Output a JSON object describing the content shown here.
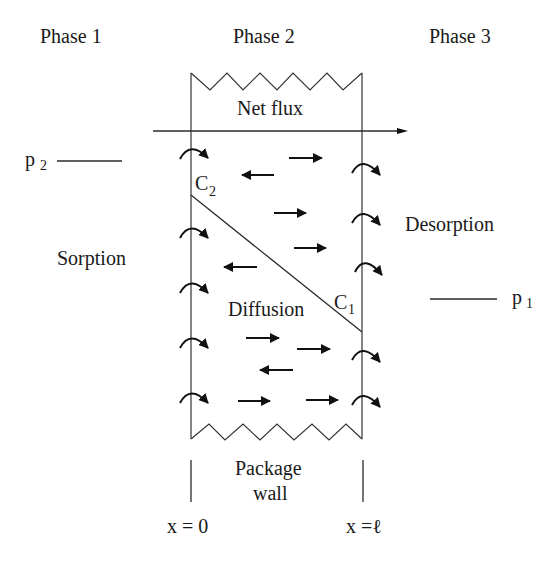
{
  "diagram": {
    "phases": {
      "phase1": "Phase 1",
      "phase2": "Phase 2",
      "phase3": "Phase 3"
    },
    "labels": {
      "net_flux": "Net flux",
      "sorption": "Sorption",
      "desorption": "Desorption",
      "diffusion": "Diffusion",
      "package": "Package",
      "wall": "wall"
    },
    "pressures": {
      "p2_base": "p",
      "p2_sub": "2",
      "p1_base": "p",
      "p1_sub": "1"
    },
    "concentrations": {
      "c2_base": "C",
      "c2_sub": "2",
      "c1_base": "C",
      "c1_sub": "1"
    },
    "positions": {
      "x0": "x = 0",
      "xl": "x =ℓ"
    },
    "colors": {
      "ink": "#111111",
      "background": "#ffffff"
    }
  }
}
